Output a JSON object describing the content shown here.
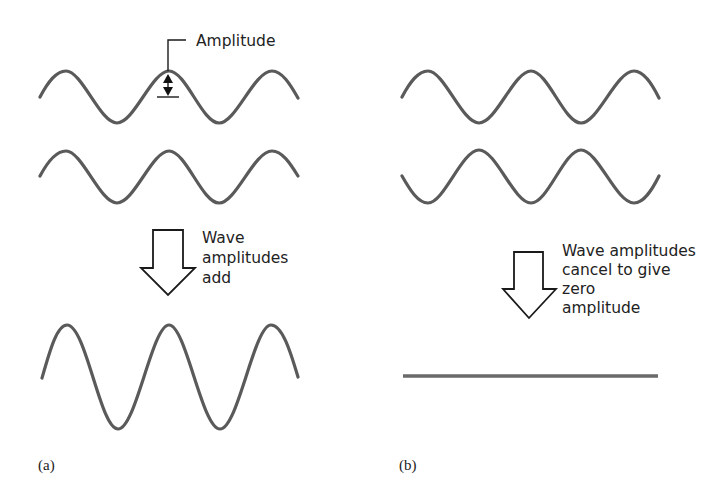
{
  "panels": {
    "a": {
      "label": "(a)",
      "annotation": "Amplitude",
      "caption_lines": [
        "Wave",
        "amplitudes",
        "add"
      ],
      "description": "Two in-phase waves combine to a wave of double amplitude"
    },
    "b": {
      "label": "(b)",
      "caption_lines": [
        "Wave amplitudes",
        "cancel to give",
        "zero",
        "amplitude"
      ],
      "description": "Two out-of-phase waves cancel to give a flat line"
    }
  },
  "colors": {
    "wave": "#5a5a5a",
    "outline": "#1a1a1a",
    "text": "#222222",
    "background": "#ffffff"
  }
}
